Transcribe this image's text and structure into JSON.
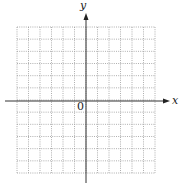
{
  "diagram": {
    "type": "cartesian-grid",
    "x_axis_label": "x",
    "y_axis_label": "y",
    "origin_label": "0",
    "grid": {
      "columns": 12,
      "rows": 12,
      "line_style": "dotted",
      "x_left": 17,
      "x_right": 155,
      "y_top": 27,
      "y_bottom": 173
    },
    "axes": {
      "y_axis_x": 86,
      "x_axis_y": 101,
      "x_axis_start": 5,
      "x_axis_end": 170,
      "y_axis_start": 13,
      "y_axis_end": 183
    },
    "colors": {
      "axis": "#333333",
      "grid": "#9a9a9a"
    }
  }
}
